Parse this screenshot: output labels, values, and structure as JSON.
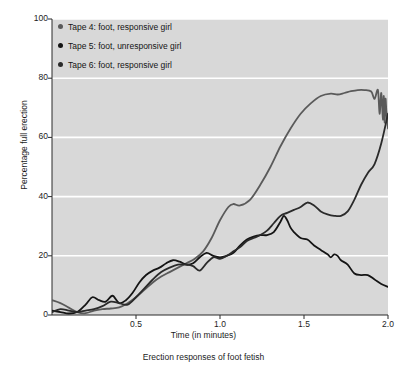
{
  "chart_data": {
    "type": "line",
    "title": "",
    "caption": "Erection responses of foot fetish",
    "xlabel": "Time (in minutes)",
    "ylabel": "Percentage full erection",
    "xlim": [
      0,
      2.0
    ],
    "ylim": [
      0,
      100
    ],
    "xticks": [
      "0.5",
      "1.0",
      "1.5",
      "2.0"
    ],
    "xtick_values": [
      0.5,
      1.0,
      1.5,
      2.0
    ],
    "yticks": [
      "0",
      "20",
      "40",
      "60",
      "80",
      "100"
    ],
    "ytick_values": [
      0,
      20,
      40,
      60,
      80,
      100
    ],
    "grid": "horizontal-white",
    "legend_position": "top-left-inside",
    "plot_background": "#d8d8d8",
    "gridline_color": "#ffffff",
    "series": [
      {
        "name": "Tape 4: foot, responsive girl",
        "color": "#5a5a5a",
        "x": [
          0.0,
          0.05,
          0.1,
          0.15,
          0.2,
          0.25,
          0.3,
          0.35,
          0.4,
          0.45,
          0.5,
          0.55,
          0.6,
          0.65,
          0.7,
          0.75,
          0.8,
          0.85,
          0.9,
          0.95,
          1.0,
          1.05,
          1.08,
          1.12,
          1.18,
          1.24,
          1.3,
          1.36,
          1.42,
          1.48,
          1.54,
          1.6,
          1.66,
          1.7,
          1.74,
          1.78,
          1.82,
          1.86,
          1.9,
          1.92,
          1.94,
          1.95,
          1.96,
          1.97,
          1.975,
          1.98,
          1.985,
          1.99,
          1.995,
          2.0
        ],
        "y": [
          5.0,
          4.0,
          2.5,
          1.0,
          0.6,
          1.5,
          2.0,
          2.2,
          2.6,
          4.0,
          6.0,
          8.5,
          11.0,
          13.0,
          14.5,
          16.0,
          17.5,
          19.0,
          21.5,
          26.0,
          32.0,
          36.5,
          37.5,
          37.0,
          39.0,
          44.0,
          50.0,
          57.0,
          63.0,
          68.0,
          71.5,
          74.0,
          74.8,
          74.5,
          75.0,
          75.6,
          76.0,
          76.0,
          75.5,
          73.0,
          76.0,
          68.0,
          75.0,
          66.0,
          74.0,
          65.0,
          73.0,
          69.0,
          66.0,
          63.0
        ]
      },
      {
        "name": "Tape 5: foot, unresponsive girl",
        "color": "#141414",
        "x": [
          0.0,
          0.05,
          0.1,
          0.15,
          0.2,
          0.24,
          0.28,
          0.32,
          0.36,
          0.4,
          0.44,
          0.48,
          0.52,
          0.56,
          0.6,
          0.64,
          0.68,
          0.72,
          0.76,
          0.8,
          0.84,
          0.88,
          0.92,
          0.96,
          1.0,
          1.04,
          1.08,
          1.12,
          1.16,
          1.2,
          1.24,
          1.28,
          1.32,
          1.36,
          1.38,
          1.4,
          1.42,
          1.44,
          1.48,
          1.52,
          1.56,
          1.6,
          1.64,
          1.66,
          1.68,
          1.7,
          1.72,
          1.76,
          1.8,
          1.84,
          1.88,
          1.92,
          1.96,
          2.0
        ],
        "y": [
          1.5,
          1.0,
          0.5,
          1.0,
          3.5,
          6.0,
          5.0,
          4.5,
          6.5,
          4.0,
          5.0,
          7.5,
          11.0,
          13.5,
          15.0,
          16.0,
          17.5,
          18.5,
          18.0,
          17.0,
          17.5,
          19.5,
          21.0,
          20.0,
          19.5,
          20.0,
          21.0,
          23.5,
          25.5,
          26.5,
          27.0,
          27.0,
          28.0,
          31.5,
          33.5,
          32.0,
          29.5,
          28.0,
          26.0,
          25.5,
          23.5,
          22.0,
          20.5,
          19.5,
          20.5,
          20.0,
          18.5,
          17.0,
          14.0,
          13.5,
          13.5,
          12.0,
          10.5,
          9.5
        ]
      },
      {
        "name": "Tape 6: foot, responsive girl",
        "color": "#2a2a2a",
        "x": [
          0.0,
          0.05,
          0.1,
          0.15,
          0.2,
          0.25,
          0.3,
          0.35,
          0.4,
          0.45,
          0.5,
          0.55,
          0.6,
          0.65,
          0.7,
          0.75,
          0.8,
          0.84,
          0.88,
          0.92,
          0.96,
          1.0,
          1.04,
          1.08,
          1.12,
          1.16,
          1.2,
          1.24,
          1.28,
          1.32,
          1.36,
          1.4,
          1.44,
          1.48,
          1.52,
          1.56,
          1.6,
          1.64,
          1.68,
          1.72,
          1.76,
          1.8,
          1.84,
          1.88,
          1.92,
          1.96,
          2.0
        ],
        "y": [
          1.0,
          2.0,
          1.5,
          1.0,
          1.5,
          2.0,
          3.0,
          4.5,
          4.0,
          3.5,
          6.0,
          9.0,
          12.0,
          14.5,
          16.0,
          17.0,
          17.0,
          16.5,
          15.0,
          17.5,
          19.5,
          19.0,
          20.0,
          21.5,
          23.0,
          25.0,
          26.0,
          27.0,
          28.5,
          31.0,
          33.5,
          34.5,
          35.5,
          36.5,
          38.0,
          37.0,
          35.0,
          34.0,
          33.5,
          33.5,
          35.0,
          39.0,
          44.0,
          48.0,
          51.0,
          58.0,
          68.0
        ]
      }
    ]
  },
  "legend": {
    "items": [
      {
        "label": "Tape 4: foot, responsive girl",
        "color": "#5a5a5a"
      },
      {
        "label": "Tape 5: foot, unresponsive girl",
        "color": "#141414"
      },
      {
        "label": "Tape 6: foot, responsive girl",
        "color": "#2a2a2a"
      }
    ]
  }
}
